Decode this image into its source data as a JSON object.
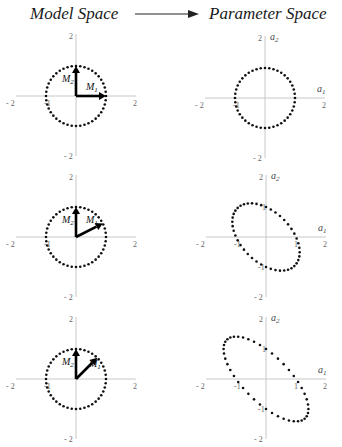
{
  "header": {
    "left_title": "Model Space",
    "right_title": "Parameter Space",
    "arrow": "right-arrow"
  },
  "axes": {
    "scale_px_per_unit": 30,
    "tick_pos": "2",
    "tick_neg": "- 2",
    "tick_one": "1",
    "tick_neg_one": "-1",
    "param_x_label": "a",
    "param_x_sub": "1",
    "param_y_label": "a",
    "param_y_sub": "2",
    "vec1_label": "M",
    "vec1_sub": "1",
    "vec2_label": "M",
    "vec2_sub": "2"
  },
  "colors": {
    "axis": "#c8c8c8",
    "dots": "#111111",
    "vectors": "#000000"
  },
  "rows": [
    {
      "model_origin": [
        76,
        96
      ],
      "param_origin": [
        265,
        98
      ],
      "m1_angle_deg": 0,
      "dot_count": 44
    },
    {
      "model_origin": [
        76,
        237
      ],
      "param_origin": [
        266,
        237
      ],
      "m1_angle_deg": 27,
      "dot_count": 44
    },
    {
      "model_origin": [
        76,
        379
      ],
      "param_origin": [
        266,
        379
      ],
      "m1_angle_deg": 45,
      "dot_count": 44
    }
  ]
}
